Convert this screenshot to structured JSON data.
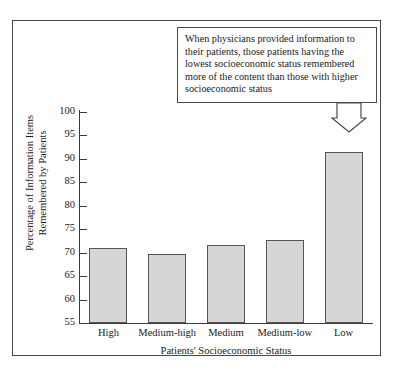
{
  "chart_data": {
    "type": "bar",
    "title": "",
    "xlabel": "Patients' Socioeconomic Status",
    "ylabel": "Percentage of Information Items Remembered by Patients",
    "ylabel_line1": "Percentage of Information Items",
    "ylabel_line2": "Remembered by Patients",
    "categories": [
      "High",
      "Medium-high",
      "Medium",
      "Medium-low",
      "Low"
    ],
    "values": [
      71.0,
      69.8,
      71.7,
      72.7,
      91.5
    ],
    "ylim": [
      55,
      100
    ],
    "yticks": [
      100,
      95,
      90,
      85,
      80,
      75,
      70,
      65,
      60,
      55
    ],
    "ytick_labels": [
      "100",
      "95",
      "90",
      "85",
      "80",
      "75",
      "70",
      "65",
      "60",
      "55"
    ],
    "grid": false,
    "legend": false,
    "bar_fill_color": "#d6d6d6",
    "bar_edge_color": "#555555",
    "axis_color": "#3b3b3b",
    "annotations": [
      {
        "name": "callout",
        "text": "When physicians provided information to their patients, those patients having the lowest socioeconomic status remembered more of the content than those with higher socioeconomic status",
        "points_to_category": "Low"
      }
    ]
  },
  "callout": {
    "text": "When physicians provided information to their patients, those patients having the lowest socioeconomic status remembered more of the content than those with higher socioeconomic status"
  },
  "axes": {
    "x_title": "Patients' Socioeconomic Status",
    "y_title_line1": "Percentage of Information Items",
    "y_title_line2": "Remembered by Patients"
  }
}
